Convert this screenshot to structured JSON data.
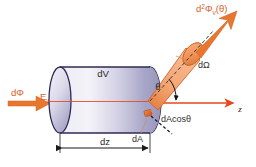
{
  "figure": {
    "background_color": "#ffffff",
    "width": 256,
    "height": 167
  },
  "colors": {
    "flux_arrow": "#e8762c",
    "cone_fill": "#f2a06a",
    "cone_outline": "#d4622a",
    "axis": "#e8461e",
    "cylinder_light": "#f0eef7",
    "cylinder_mid": "#c9c7dd",
    "cylinder_dark": "#9b9ac0",
    "cylinder_outline": "#2e2a55",
    "label_text": "#33302f",
    "leader_line": "#c98f6e"
  },
  "labels": {
    "incident_flux": {
      "base": "d",
      "symbol": "Φ",
      "text": "dΦ"
    },
    "photon_energy": {
      "base": "E",
      "sub": "ν",
      "text": "Eν"
    },
    "volume_element": {
      "text": "dV"
    },
    "thickness": {
      "text": "dz"
    },
    "area_element": {
      "text": "dA"
    },
    "projected_area": {
      "text": "dAcosθ"
    },
    "solid_angle": {
      "text": "dΩ"
    },
    "angle": {
      "text": "θ"
    },
    "axis_z": {
      "text": "z"
    },
    "emitted_flux": {
      "base": "d",
      "sup": "2",
      "symbol": "Φ",
      "sub": "ν",
      "arg": "(θ)",
      "text": "d²Φν(θ)"
    }
  },
  "geometry": {
    "cylinder": {
      "left_center_x": 60,
      "right_center_x": 150,
      "center_y": 100,
      "radius_x": 11,
      "radius_y": 33
    },
    "cone": {
      "apex_x": 148,
      "apex_y": 101,
      "axis_angle_deg": 38
    },
    "z_axis": {
      "x1": 60,
      "x2": 236,
      "y": 103
    },
    "dz_dimension": {
      "x1": 60,
      "x2": 150,
      "y": 147
    }
  }
}
